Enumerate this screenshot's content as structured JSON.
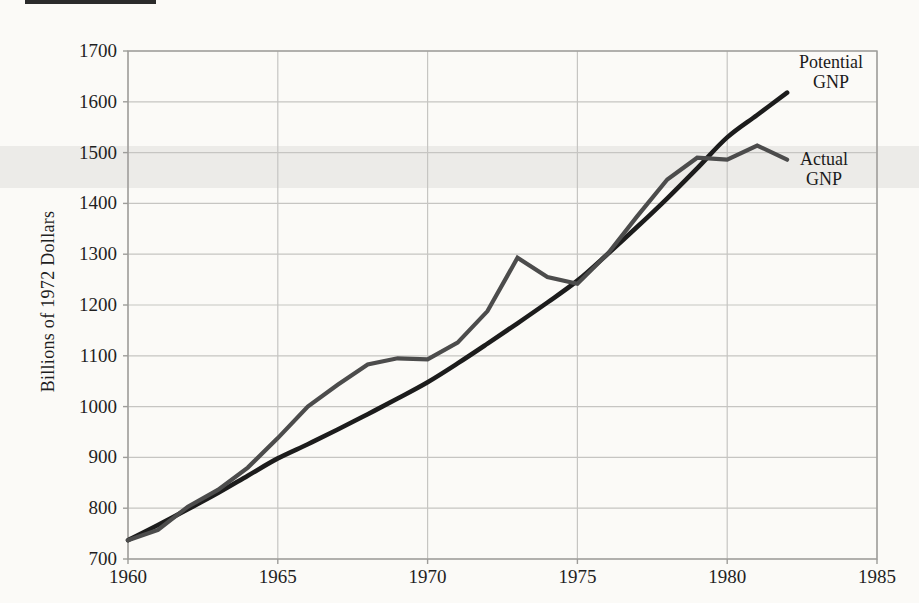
{
  "page": {
    "top_rule_present": true,
    "y_axis_title": "Billions of 1972 Dollars"
  },
  "chart_data": {
    "type": "line",
    "title": "",
    "xlabel": "",
    "ylabel": "Billions of 1972 Dollars",
    "xlim": [
      1960,
      1985
    ],
    "ylim": [
      700,
      1700
    ],
    "x_ticks": [
      1960,
      1965,
      1970,
      1975,
      1980,
      1985
    ],
    "y_ticks": [
      700,
      800,
      900,
      1000,
      1100,
      1200,
      1300,
      1400,
      1500,
      1600,
      1700
    ],
    "grid": "on",
    "legend_position": "right-inline",
    "x": [
      1960,
      1961,
      1962,
      1963,
      1964,
      1965,
      1966,
      1967,
      1968,
      1969,
      1970,
      1971,
      1972,
      1973,
      1974,
      1975,
      1976,
      1977,
      1978,
      1979,
      1980,
      1981,
      1982
    ],
    "series": [
      {
        "name": "Potential GNP",
        "label_lines": [
          "Potential",
          "GNP"
        ],
        "color": "#1c1c1c",
        "stroke_width": 4.6,
        "smooth": true,
        "values": [
          737,
          767,
          798,
          830,
          864,
          898,
          926,
          955,
          985,
          1016,
          1048,
          1085,
          1124,
          1164,
          1205,
          1248,
          1300,
          1354,
          1410,
          1469,
          1530,
          1574,
          1618
        ]
      },
      {
        "name": "Actual GNP",
        "label_lines": [
          "Actual",
          "GNP"
        ],
        "color": "#4c4c4c",
        "stroke_width": 4.2,
        "smooth": false,
        "values": [
          737,
          757,
          803,
          836,
          880,
          938,
          1000,
          1043,
          1083,
          1095,
          1093,
          1126,
          1188,
          1293,
          1255,
          1242,
          1300,
          1375,
          1447,
          1490,
          1486,
          1514,
          1486
        ]
      }
    ],
    "colors": {
      "grid": "#c6c5c2",
      "frame": "#9d9c99",
      "tick_text": "#1f1f1f",
      "background": "#fbfaf7"
    }
  }
}
